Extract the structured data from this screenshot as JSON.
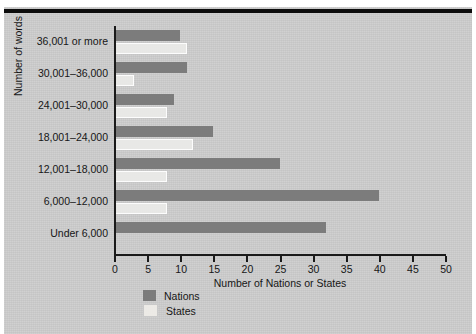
{
  "chart_data": {
    "type": "bar",
    "orientation": "horizontal",
    "title": "",
    "xlabel": "Number of Nations or States",
    "ylabel": "Number of words",
    "xlim": [
      0,
      50
    ],
    "xticks": [
      0,
      5,
      10,
      15,
      20,
      25,
      30,
      35,
      40,
      45,
      50
    ],
    "grid": false,
    "legend_position": "bottom-left",
    "categories": [
      "36,001 or more",
      "30,001–36,000",
      "24,001–30,000",
      "18,001–24,000",
      "12,001–18,000",
      "6,000–12,000",
      "Under 6,000"
    ],
    "series": [
      {
        "name": "Nations",
        "color": "#7c7c7c",
        "values": [
          10,
          11,
          9,
          15,
          25,
          40,
          32
        ]
      },
      {
        "name": "States",
        "color": "#e8e8e6",
        "values": [
          11,
          3,
          8,
          12,
          8,
          8,
          0
        ]
      }
    ]
  },
  "axis": {
    "x_title": "Number of Nations or States",
    "y_title": "Number of words",
    "tick_labels": [
      "0",
      "5",
      "10",
      "15",
      "20",
      "25",
      "30",
      "35",
      "40",
      "45",
      "50"
    ]
  },
  "legend": {
    "items": [
      {
        "label": "Nations",
        "swatch": "nations"
      },
      {
        "label": "States",
        "swatch": "states"
      }
    ]
  },
  "colors": {
    "page_background": "#cdcdcd",
    "nations_bar": "#7c7c7c",
    "states_bar": "#e8e8e6",
    "axis": "#1a1a1a",
    "rule": "#0d0d0d"
  }
}
